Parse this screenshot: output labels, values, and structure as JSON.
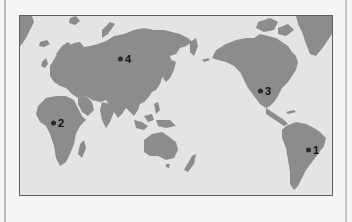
{
  "map": {
    "projection": "pacific-centered world map",
    "colors": {
      "land": "#8c8c8c",
      "ocean": "#e4e4e4",
      "border": "#5e5e5e",
      "marker": "#2a2a2a",
      "label": "#111111"
    },
    "markers": [
      {
        "id": "1",
        "label": "1",
        "region": "eastern Brazil",
        "x": 295,
        "y": 135
      },
      {
        "id": "2",
        "label": "2",
        "region": "West Africa (Sahel)",
        "x": 35,
        "y": 107
      },
      {
        "id": "3",
        "label": "3",
        "region": "central United States",
        "x": 242,
        "y": 75
      },
      {
        "id": "4",
        "label": "4",
        "region": "Siberia, Russia",
        "x": 101,
        "y": 43
      }
    ]
  }
}
